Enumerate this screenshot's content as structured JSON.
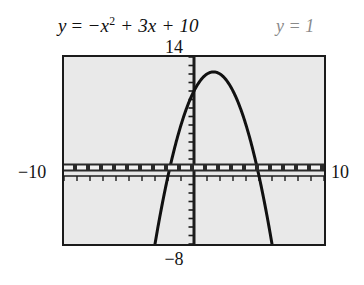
{
  "figure": {
    "equation_primary": {
      "lhs": "y",
      "eq": "=",
      "term1": "−x",
      "exponent": "2",
      "term2": "+ 3x",
      "term3": "+ 10",
      "full": "y = −x² + 3x + 10"
    },
    "equation_secondary": {
      "full": "y = 1",
      "color": "#8a8a8a"
    },
    "labels": {
      "ymax": "14",
      "ymin": "−8",
      "xmin": "−10",
      "xmax": "10"
    },
    "colors": {
      "plot_background": "#e9e9e9",
      "border": "#1b1b1b",
      "curve": "#111111",
      "axis": "#1c1c1c",
      "highlight_line": "#2a2a2a",
      "highlight_dash": "#f2f2f2",
      "secondary_text": "#8a8a8a"
    }
  },
  "chart_data": {
    "type": "line",
    "xlabel": "x",
    "ylabel": "y",
    "xlim": [
      -10,
      10
    ],
    "ylim": [
      -8,
      14
    ],
    "xtick_labels": [
      "−10",
      "10"
    ],
    "ytick_labels": [
      "−8",
      "14"
    ],
    "xscale": 1,
    "yscale": 1,
    "grid": false,
    "legend": "none",
    "series": [
      {
        "name": "y = −x² + 3x + 10",
        "kind": "parabola",
        "style": "solid",
        "width": 3,
        "color": "#111111",
        "coefficients": {
          "a": -1,
          "b": 3,
          "c": 10
        },
        "vertex": [
          1.5,
          12.25
        ],
        "roots": [
          -2,
          5
        ],
        "y_intercept": 10,
        "x": [
          -4.3,
          -4.0,
          -3.5,
          -3.0,
          -2.5,
          -2.0,
          -1.5,
          -1.0,
          -0.5,
          0.0,
          0.5,
          1.0,
          1.5,
          2.0,
          2.5,
          3.0,
          3.5,
          4.0,
          4.5,
          5.0,
          5.5,
          6.0,
          6.5,
          7.0,
          7.3
        ],
        "y": [
          -21.39,
          -18.0,
          -12.75,
          -8.0,
          -3.75,
          0.0,
          3.25,
          6.0,
          8.25,
          10.0,
          11.25,
          12.0,
          12.25,
          12.0,
          11.25,
          10.0,
          8.25,
          6.0,
          3.25,
          0.0,
          -3.75,
          -8.0,
          -12.75,
          -18.0,
          -21.39
        ]
      },
      {
        "name": "y = 1",
        "kind": "horizontal-line",
        "style": "thick-dashed",
        "width": 8,
        "color": "#2a2a2a",
        "value": 1,
        "x": [
          -10,
          10
        ],
        "y": [
          1,
          1
        ]
      }
    ],
    "intersections": [
      [
        -2.7,
        1
      ],
      [
        3.7,
        1
      ]
    ],
    "axes": {
      "x_axis_y": 0,
      "y_axis_x": 0,
      "tick_spacing_x": 1,
      "tick_spacing_y": 1,
      "tick_style": "hash-marks"
    }
  }
}
